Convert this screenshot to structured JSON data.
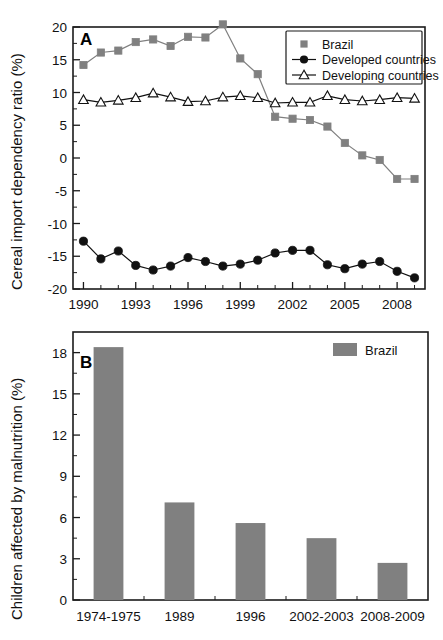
{
  "figure": {
    "background": "#ffffff",
    "gray": "#808080",
    "black": "#111111"
  },
  "chart_data": [
    {
      "panel": "A",
      "type": "line",
      "title": "",
      "xlabel": "",
      "ylabel": "Cereal import dependency ratio (%)",
      "xlim": [
        1989.4,
        2009.6
      ],
      "ylim": [
        -20,
        20
      ],
      "xticks": [
        1990,
        1993,
        1996,
        1999,
        2002,
        2005,
        2008
      ],
      "xticklabels": [
        "1990",
        "1993",
        "1996",
        "1999",
        "2002",
        "2005",
        "2008"
      ],
      "yticks": [
        -20,
        -15,
        -10,
        -5,
        0,
        5,
        10,
        15,
        20
      ],
      "yticklabels": [
        "-20",
        "-15",
        "-10",
        "-5",
        "0",
        "5",
        "10",
        "15",
        "20"
      ],
      "grid": false,
      "legend_position": "top-right",
      "x": [
        1990,
        1991,
        1992,
        1993,
        1994,
        1995,
        1996,
        1997,
        1998,
        1999,
        2000,
        2001,
        2002,
        2003,
        2004,
        2005,
        2006,
        2007,
        2008,
        2009
      ],
      "series": [
        {
          "name": "Brazil",
          "marker": "square",
          "color": "#808080",
          "filled": true,
          "values": [
            14.2,
            16.1,
            16.4,
            17.7,
            18.1,
            17.1,
            18.5,
            18.4,
            20.4,
            15.2,
            12.8,
            6.3,
            6.0,
            5.8,
            4.8,
            2.3,
            0.4,
            -0.3,
            -3.2,
            -3.2
          ]
        },
        {
          "name": "Developed countries",
          "marker": "circle",
          "color": "#111111",
          "filled": true,
          "values": [
            -12.7,
            -15.4,
            -14.2,
            -16.4,
            -17.1,
            -16.5,
            -15.2,
            -15.8,
            -16.5,
            -16.2,
            -15.6,
            -14.5,
            -14.1,
            -14.1,
            -16.3,
            -16.9,
            -16.2,
            -15.8,
            -17.3,
            -18.3
          ]
        },
        {
          "name": "Developing countries",
          "marker": "triangle",
          "color": "#111111",
          "filled": false,
          "values": [
            8.9,
            8.5,
            8.8,
            9.2,
            9.9,
            9.3,
            8.6,
            8.7,
            9.3,
            9.5,
            9.2,
            8.4,
            8.5,
            8.5,
            9.5,
            8.9,
            8.7,
            8.9,
            9.2,
            9.1
          ]
        }
      ],
      "legend": [
        "Brazil",
        "Developed countries",
        "Developing countries"
      ]
    },
    {
      "panel": "B",
      "type": "bar",
      "title": "",
      "xlabel": "",
      "ylabel": "Children affected by malnutrition (%)",
      "ylim": [
        0,
        19.5
      ],
      "yticks": [
        0,
        3,
        6,
        9,
        12,
        15,
        18
      ],
      "yticklabels": [
        "0",
        "3",
        "6",
        "9",
        "12",
        "15",
        "18"
      ],
      "grid": false,
      "legend_position": "top-right",
      "legend": [
        "Brazil"
      ],
      "bar_color": "#808080",
      "categories": [
        "1974-1975",
        "1989",
        "1996",
        "2002-2003",
        "2008-2009"
      ],
      "values": [
        18.4,
        7.1,
        5.6,
        4.5,
        2.7
      ],
      "series_name": "Brazil"
    }
  ]
}
